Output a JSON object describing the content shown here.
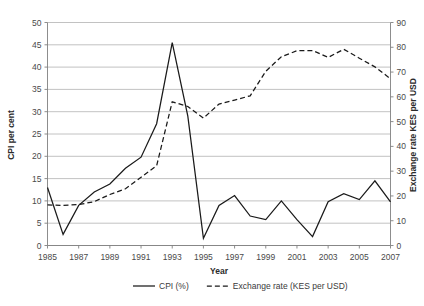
{
  "chart_data": {
    "type": "line",
    "title": "",
    "xlabel": "Year",
    "ylabel": "CPI per cent",
    "y2label": "Exchange rate KES per USD",
    "grid": true,
    "legend_position": "bottom",
    "xlim": [
      1985,
      2007
    ],
    "ylim": [
      0,
      50
    ],
    "y2lim": [
      0,
      90
    ],
    "xticks": [
      1985,
      1987,
      1989,
      1991,
      1993,
      1995,
      1997,
      1999,
      2001,
      2003,
      2005,
      2007
    ],
    "xtick_labels": [
      "1985",
      "1987",
      "1989",
      "1991",
      "1993",
      "1995",
      "1997",
      "1999",
      "2001",
      "2003",
      "2005",
      "2007"
    ],
    "yticks": [
      0,
      5,
      10,
      15,
      20,
      25,
      30,
      35,
      40,
      45,
      50
    ],
    "ytick_labels": [
      "0",
      "5",
      "10",
      "15",
      "20",
      "25",
      "30",
      "35",
      "40",
      "45",
      "50"
    ],
    "y2ticks": [
      0,
      10,
      20,
      30,
      40,
      50,
      60,
      70,
      80,
      90
    ],
    "y2tick_labels": [
      "0",
      "10",
      "20",
      "30",
      "40",
      "50",
      "60",
      "70",
      "80",
      "90"
    ],
    "x": [
      1985,
      1986,
      1987,
      1988,
      1989,
      1990,
      1991,
      1992,
      1993,
      1994,
      1995,
      1996,
      1997,
      1998,
      1999,
      2000,
      2001,
      2002,
      2003,
      2004,
      2005,
      2006,
      2007
    ],
    "series": [
      {
        "name": "CPI (%)",
        "axis": "left",
        "style": "solid",
        "color": "#1a1a1a",
        "values": [
          13.0,
          2.5,
          9.0,
          12.0,
          13.8,
          17.3,
          19.8,
          27.3,
          45.5,
          29.0,
          1.6,
          9.0,
          11.2,
          6.6,
          5.8,
          10.0,
          5.8,
          2.0,
          9.8,
          11.6,
          10.3,
          14.5,
          9.8
        ]
      },
      {
        "name": "Exchange rate (KES per USD)",
        "axis": "right",
        "style": "dashed",
        "color": "#1a1a1a",
        "values": [
          16.4,
          16.2,
          16.5,
          17.7,
          20.6,
          22.9,
          27.5,
          32.2,
          58.0,
          56.1,
          51.4,
          57.1,
          58.7,
          60.4,
          70.3,
          76.2,
          78.6,
          78.7,
          75.9,
          79.2,
          75.6,
          72.1,
          67.3
        ]
      }
    ],
    "legend": [
      {
        "label": "CPI (%)",
        "style": "solid"
      },
      {
        "label": "Exchange rate (KES per USD)",
        "style": "dashed"
      }
    ]
  }
}
